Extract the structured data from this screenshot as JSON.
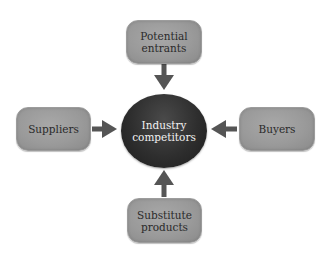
{
  "diagram": {
    "center": {
      "label": "Industry\ncompetitors"
    },
    "nodes": {
      "top": {
        "label": "Potential\nentrants"
      },
      "left": {
        "label": "Suppliers"
      },
      "right": {
        "label": "Buyers"
      },
      "bottom": {
        "label": "Substitute\nproducts"
      }
    },
    "edges": [
      {
        "from": "Potential entrants",
        "to": "Industry competitors",
        "direction": "down"
      },
      {
        "from": "Suppliers",
        "to": "Industry competitors",
        "direction": "right"
      },
      {
        "from": "Buyers",
        "to": "Industry competitors",
        "direction": "left"
      },
      {
        "from": "Substitute products",
        "to": "Industry competitors",
        "direction": "up"
      }
    ],
    "colors": {
      "box_fill": "#9a9a9a",
      "center_fill": "#2e2e2e",
      "arrow": "#555555",
      "box_text": "#2a2a2a",
      "center_text": "#f2f2f2"
    }
  }
}
